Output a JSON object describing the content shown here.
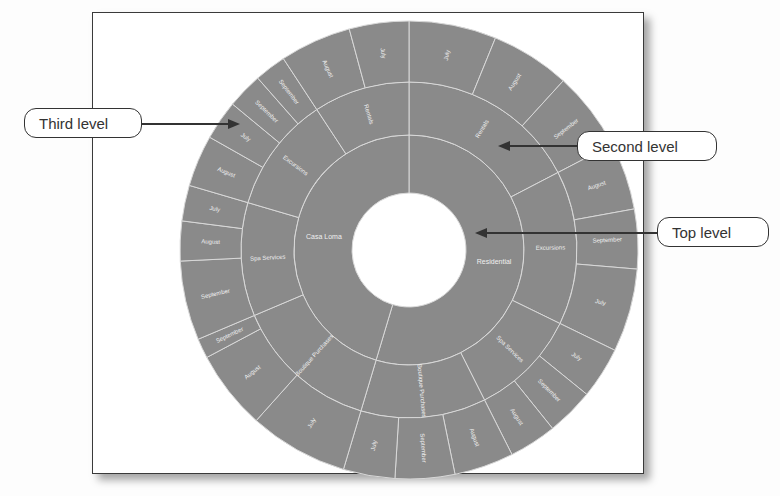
{
  "chart_data": {
    "type": "sunburst",
    "title": "",
    "colors": {
      "fill": "#8a8a8a",
      "divider": "#d8d8d8",
      "label": "#f0f0f0",
      "background": "#ffffff"
    },
    "levels": [
      "Top level",
      "Second level",
      "Third level"
    ],
    "hierarchy": [
      {
        "name": "Residential",
        "children": [
          {
            "name": "Rentals",
            "children": [
              {
                "name": "July",
                "value": 22
              },
              {
                "name": "August",
                "value": 20
              },
              {
                "name": "September",
                "value": 20
              }
            ]
          },
          {
            "name": "Excursions",
            "children": [
              {
                "name": "August",
                "value": 17
              },
              {
                "name": "September",
                "value": 15
              },
              {
                "name": "July",
                "value": 21
              }
            ]
          },
          {
            "name": "Spa Services",
            "children": [
              {
                "name": "July",
                "value": 13
              },
              {
                "name": "September",
                "value": 12
              },
              {
                "name": "August",
                "value": 12
              }
            ]
          },
          {
            "name": "Boutique Purchases",
            "children": [
              {
                "name": "August",
                "value": 15
              },
              {
                "name": "September",
                "value": 15
              },
              {
                "name": "July",
                "value": 13
              }
            ]
          }
        ]
      },
      {
        "name": "Casa Loma",
        "children": [
          {
            "name": "Boutique Purchases",
            "children": [
              {
                "name": "July",
                "value": 25
              },
              {
                "name": "August",
                "value": 20
              },
              {
                "name": "September",
                "value": 5
              }
            ]
          },
          {
            "name": "Spa Services",
            "children": [
              {
                "name": "September",
                "value": 20
              },
              {
                "name": "August",
                "value": 10
              },
              {
                "name": "July",
                "value": 9
              }
            ]
          },
          {
            "name": "Excursions",
            "children": [
              {
                "name": "August",
                "value": 13
              },
              {
                "name": "July",
                "value": 10
              },
              {
                "name": "September",
                "value": 9
              },
              {
                "name": "September",
                "value": 8
              }
            ]
          },
          {
            "name": "Rentals",
            "children": [
              {
                "name": "August",
                "value": 18
              },
              {
                "name": "July",
                "value": 15
              }
            ]
          }
        ]
      }
    ]
  },
  "callouts": {
    "third_level": "Third level",
    "second_level": "Second level",
    "top_level": "Top level"
  }
}
